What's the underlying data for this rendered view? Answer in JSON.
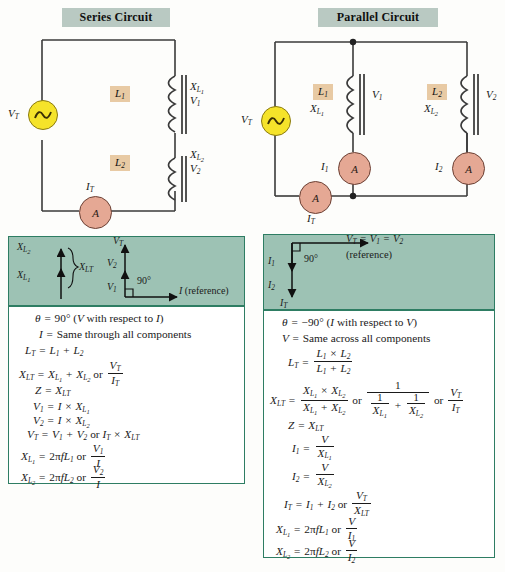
{
  "series": {
    "title": "Series Circuit",
    "source_label": "V_T",
    "components": [
      {
        "box": "L₁",
        "reactance": "X_L₁",
        "voltage": "V₁"
      },
      {
        "box": "L₂",
        "reactance": "X_L₂",
        "voltage": "V₂"
      }
    ],
    "meter": {
      "symbol": "A",
      "label": "I_T"
    },
    "phasor": {
      "reactance_stack": [
        "X_L₂",
        "X_L₁"
      ],
      "reactance_total": "X_LT",
      "voltage_stack": [
        "V_T",
        "V₂",
        "V₁"
      ],
      "angle": "90°",
      "axis": "I (reference)"
    },
    "equations": [
      "θ = 90° (V with respect to I)",
      "I = Same through all components",
      "L_T = L₁ + L₂",
      "X_LT = X_L₁ + X_L₂ or V_T/I_T",
      "Z = X_LT",
      "V₁ = I × X_L₁",
      "V₂ = I × X_L₂",
      "V_T = V₁ + V₂ or I_T × X_LT",
      "X_L₁ = 2πfL₁ or V₁/I",
      "X_L₂ = 2πfL₂ or V₂/I"
    ]
  },
  "parallel": {
    "title": "Parallel Circuit",
    "source_label": "V_T",
    "branches": [
      {
        "box": "L₁",
        "reactance": "X_L₁",
        "voltage": "V₁",
        "current": "I₁",
        "meter": "A"
      },
      {
        "box": "L₂",
        "reactance": "X_L₂",
        "voltage": "V₂",
        "current": "I₂",
        "meter": "A"
      }
    ],
    "meter": {
      "symbol": "A",
      "label": "I_T"
    },
    "phasor": {
      "angle": "90°",
      "reference_line_1": "V_T = V₁ = V₂",
      "reference_line_2": "(reference)",
      "currents": [
        "I₁",
        "I₂",
        "I_T"
      ]
    },
    "equations": [
      "θ = −90° (I with respect to V)",
      "V = Same across all components",
      "L_T = (L₁ × L₂)/(L₁ + L₂)",
      "X_LT = (X_L₁ × X_L₂)/(X_L₁ + X_L₂) or 1/(1/X_L₁ + 1/X_L₂) or V_T/I_T",
      "Z = X_LT",
      "I₁ = V/X_L₁",
      "I₂ = V/X_L₂",
      "I_T = I₁ + I₂ or V_T/X_LT",
      "X_L₁ = 2πfL₁ or V/I₁",
      "X_L₂ = 2πfL₂ or V/I₂"
    ]
  },
  "colors": {
    "title_band": "#b9c9c2",
    "phasor_bg": "#9dc2b4",
    "panel_border": "#2e7d63",
    "source": "#f5e32a",
    "meter": "#e5a894",
    "component_box": "#e8caa4",
    "wire": "#3a3a3a"
  },
  "icons": {
    "ac_source": "sine-wave",
    "ammeter": "A",
    "inductor": "coil-with-core"
  }
}
